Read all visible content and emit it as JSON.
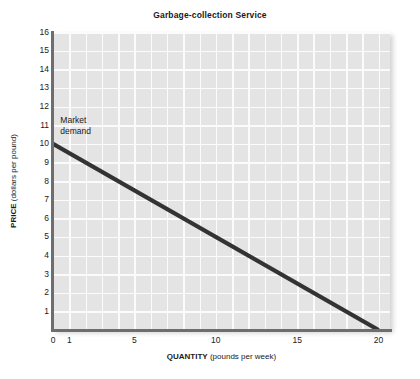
{
  "chart_data": {
    "type": "line",
    "title": "Garbage-collection Service",
    "xlabel_bold": "QUANTITY",
    "xlabel_rest": " (pounds per week)",
    "ylabel_bold": "PRICE",
    "ylabel_rest": " (dollars per pound)",
    "xlim": [
      0,
      20.7
    ],
    "ylim": [
      0,
      16
    ],
    "grid": true,
    "grid_x_step": 1,
    "grid_y_step": 1,
    "legend_position": "inline-annotation",
    "xticks": [
      0,
      1,
      5,
      10,
      15,
      20
    ],
    "xtick_labels": [
      "0",
      "1",
      "5",
      "10",
      "15",
      "20"
    ],
    "yticks": [
      1,
      2,
      3,
      4,
      5,
      6,
      7,
      8,
      9,
      10,
      11,
      12,
      13,
      14,
      15,
      16
    ],
    "ytick_labels": [
      "1",
      "2",
      "3",
      "4",
      "5",
      "6",
      "7",
      "8",
      "9",
      "10",
      "11",
      "12",
      "13",
      "14",
      "15",
      "16"
    ],
    "series": [
      {
        "name": "Market demand",
        "annotation": [
          "Market",
          "demand"
        ],
        "annotation_at": {
          "x": 0.45,
          "y": 11.3
        },
        "color": "#333333",
        "linewidth": 4,
        "x": [
          0,
          20
        ],
        "y": [
          10,
          0
        ],
        "points": [
          {
            "x": 0,
            "y": 10
          },
          {
            "x": 2,
            "y": 9
          },
          {
            "x": 4,
            "y": 8
          },
          {
            "x": 6,
            "y": 7
          },
          {
            "x": 8,
            "y": 6
          },
          {
            "x": 10,
            "y": 5
          },
          {
            "x": 12,
            "y": 4
          },
          {
            "x": 14,
            "y": 3
          },
          {
            "x": 16,
            "y": 2
          },
          {
            "x": 18,
            "y": 1
          },
          {
            "x": 20,
            "y": 0
          }
        ]
      }
    ],
    "plot_bg_color": "#e4e4e4",
    "grid_color": "#fbfbfb",
    "axis_color": "#6e6e6e"
  }
}
